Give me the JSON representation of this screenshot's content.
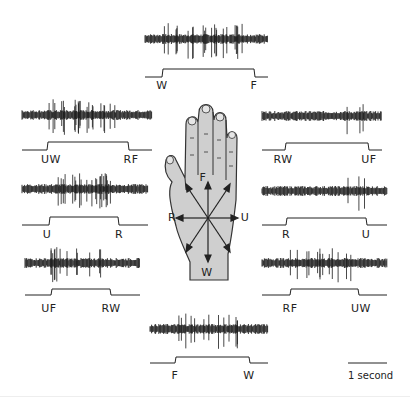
{
  "figure": {
    "colors": {
      "trace": "#1a1a1a",
      "hand_fill": "#cfcfcf",
      "hand_outline": "#333333",
      "background": "#ffffff"
    },
    "hand": {
      "direction_labels": {
        "flexion": "F",
        "extension": "W",
        "radial": "R",
        "ulnar": "U"
      }
    },
    "recordings": [
      {
        "id": "top",
        "start_label": "W",
        "end_label": "F",
        "activity": "high"
      },
      {
        "id": "left-1",
        "start_label": "UW",
        "end_label": "RF",
        "activity": "high"
      },
      {
        "id": "right-1",
        "start_label": "RW",
        "end_label": "UF",
        "activity": "low"
      },
      {
        "id": "left-2",
        "start_label": "U",
        "end_label": "R",
        "activity": "high"
      },
      {
        "id": "right-2",
        "start_label": "R",
        "end_label": "U",
        "activity": "low"
      },
      {
        "id": "left-3",
        "start_label": "UF",
        "end_label": "RW",
        "activity": "medium"
      },
      {
        "id": "right-3",
        "start_label": "RF",
        "end_label": "UW",
        "activity": "medium"
      },
      {
        "id": "bottom",
        "start_label": "F",
        "end_label": "W",
        "activity": "medium"
      }
    ],
    "scale_bar": {
      "label": "1 second"
    }
  }
}
